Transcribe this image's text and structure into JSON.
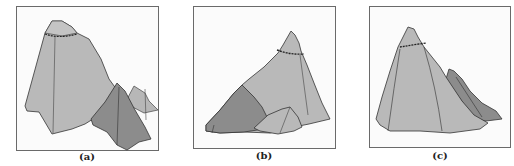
{
  "figure": {
    "panels": [
      {
        "id": "a",
        "label": "(a)",
        "description": "Tall mountain with smaller darker peak in front and small peak behind at right"
      },
      {
        "id": "b",
        "label": "(b)",
        "description": "Mountain with darker slope at left and small rock in front"
      },
      {
        "id": "c",
        "label": "(c)",
        "description": "Mountain with darker ridge behind at right"
      }
    ],
    "colors": {
      "light_fill": "#b9b9b9",
      "dark_fill": "#8a8a8a",
      "outline": "#333333",
      "frame": "#6a6a6a"
    }
  }
}
